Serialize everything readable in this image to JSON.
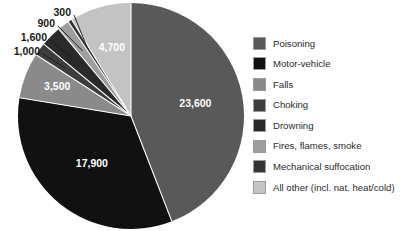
{
  "chart_data": {
    "type": "pie",
    "title": "",
    "subtitle": "",
    "xlabel": "",
    "ylabel": "",
    "legend_position": "right",
    "grid": false,
    "total": 53500,
    "categories": [
      "Poisoning",
      "Motor-vehicle",
      "Falls",
      "Choking",
      "Drowning",
      "Fires, flames, smoke",
      "Mechanical suffocation",
      "All other (incl. nat. heat/cold)"
    ],
    "values": [
      23600,
      17900,
      3500,
      1000,
      1600,
      900,
      300,
      4700
    ],
    "value_labels": [
      "23,600",
      "17,900",
      "3,500",
      "1,000",
      "1,600",
      "900",
      "300",
      "4,700"
    ],
    "colors": [
      "#595959",
      "#111111",
      "#8a8a8a",
      "#3d3d3d",
      "#2a2a2a",
      "#9e9e9e",
      "#333333",
      "#c3c3c3"
    ],
    "slices": [
      {
        "name": "Poisoning",
        "value": 23600,
        "label": "23,600",
        "color": "#595959",
        "label_mode": "inside"
      },
      {
        "name": "Motor-vehicle",
        "value": 17900,
        "label": "17,900",
        "color": "#111111",
        "label_mode": "inside"
      },
      {
        "name": "Falls",
        "value": 3500,
        "label": "3,500",
        "color": "#8a8a8a",
        "label_mode": "inside"
      },
      {
        "name": "Choking",
        "value": 1000,
        "label": "1,000",
        "color": "#3d3d3d",
        "label_mode": "callout"
      },
      {
        "name": "Drowning",
        "value": 1600,
        "label": "1,600",
        "color": "#2a2a2a",
        "label_mode": "callout"
      },
      {
        "name": "Fires, flames, smoke",
        "value": 900,
        "label": "900",
        "color": "#9e9e9e",
        "label_mode": "callout"
      },
      {
        "name": "Mechanical suffocation",
        "value": 300,
        "label": "300",
        "color": "#333333",
        "label_mode": "callout"
      },
      {
        "name": "All other (incl. nat. heat/cold)",
        "value": 4700,
        "label": "4,700",
        "color": "#c3c3c3",
        "label_mode": "inside"
      }
    ]
  },
  "legend": {
    "items": [
      {
        "label": "Poisoning",
        "color": "#595959"
      },
      {
        "label": "Motor-vehicle",
        "color": "#111111"
      },
      {
        "label": "Falls",
        "color": "#8a8a8a"
      },
      {
        "label": "Choking",
        "color": "#3d3d3d"
      },
      {
        "label": "Drowning",
        "color": "#2a2a2a"
      },
      {
        "label": "Fires, flames, smoke",
        "color": "#9e9e9e"
      },
      {
        "label": "Mechanical suffocation",
        "color": "#333333"
      },
      {
        "label": "All other (incl. nat. heat/cold)",
        "color": "#c3c3c3"
      }
    ]
  },
  "callouts": [
    {
      "label": "300",
      "x": 71,
      "y": 13
    },
    {
      "label": "900",
      "x": 55,
      "y": 24
    },
    {
      "label": "1,600",
      "x": 47,
      "y": 38
    },
    {
      "label": "1,000",
      "x": 40,
      "y": 52
    }
  ]
}
